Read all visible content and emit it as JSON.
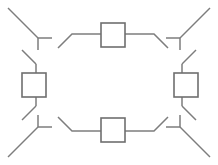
{
  "canvas": {
    "width": 218,
    "height": 165,
    "background": "#ffffff",
    "title": "Symmetric rectangular line diagram with four square nodes"
  },
  "style": {
    "line_color": "#7d7d7d",
    "line_width": 1.5,
    "node_stroke_color": "#6f6f6f",
    "node_stroke_width": 1.6,
    "node_fill": "#ffffff"
  },
  "nodes": [
    {
      "id": "node-top",
      "label": "top-square",
      "x": 101,
      "y": 23,
      "width": 24,
      "height": 24
    },
    {
      "id": "node-bottom",
      "label": "bottom-square",
      "x": 101,
      "y": 118,
      "width": 24,
      "height": 24
    },
    {
      "id": "node-left",
      "label": "left-square",
      "x": 22,
      "y": 73,
      "width": 24,
      "height": 24
    },
    {
      "id": "node-right",
      "label": "right-square",
      "x": 174,
      "y": 73,
      "width": 24,
      "height": 24
    }
  ],
  "edges": [
    {
      "id": "edge-top-left-lead",
      "label": "top-left-outward-diagonal",
      "points": "8,8 38,38"
    },
    {
      "id": "edge-top-left-horizontal",
      "label": "top-left-horizontal-stub",
      "points": "38,38 52,38"
    },
    {
      "id": "edge-top-left-tick",
      "label": "top-left-vertical-tick",
      "points": "38,38 38,50"
    },
    {
      "id": "edge-top-left-to-square",
      "label": "top-left-rise-into-top-square",
      "points": "58,48 72,34 101,34"
    },
    {
      "id": "edge-top-right-to-square",
      "label": "top-right-rise-into-top-square",
      "points": "125,34 154,34 168,48"
    },
    {
      "id": "edge-top-right-horizontal",
      "label": "top-right-horizontal-stub",
      "points": "166,38 180,38"
    },
    {
      "id": "edge-top-right-tick",
      "label": "top-right-vertical-tick",
      "points": "180,38 180,50"
    },
    {
      "id": "edge-top-right-lead",
      "label": "top-right-outward-diagonal",
      "points": "180,38 210,8"
    },
    {
      "id": "edge-left-upper-lead",
      "label": "left-upper-outward-diagonal",
      "points": "22,50 36,64"
    },
    {
      "id": "edge-left-upper-vertical",
      "label": "left-upper-vertical-into-square",
      "points": "36,64 36,73"
    },
    {
      "id": "edge-left-lower-vertical",
      "label": "left-lower-vertical-from-square",
      "points": "36,97 36,106"
    },
    {
      "id": "edge-left-lower-lead",
      "label": "left-lower-outward-diagonal",
      "points": "36,106 22,120"
    },
    {
      "id": "edge-right-upper-lead",
      "label": "right-upper-outward-diagonal",
      "points": "196,50 182,64"
    },
    {
      "id": "edge-right-upper-vertical",
      "label": "right-upper-vertical-into-square",
      "points": "182,64 182,73"
    },
    {
      "id": "edge-right-lower-vertical",
      "label": "right-lower-vertical-from-square",
      "points": "182,97 182,106"
    },
    {
      "id": "edge-right-lower-lead",
      "label": "right-lower-outward-diagonal",
      "points": "182,106 196,120"
    },
    {
      "id": "edge-bottom-left-lead",
      "label": "bottom-left-outward-diagonal",
      "points": "8,157 38,127"
    },
    {
      "id": "edge-bottom-left-horizontal",
      "label": "bottom-left-horizontal-stub",
      "points": "38,127 52,127"
    },
    {
      "id": "edge-bottom-left-tick",
      "label": "bottom-left-vertical-tick",
      "points": "38,127 38,115"
    },
    {
      "id": "edge-bottom-left-to-square",
      "label": "bottom-left-drop-into-bottom-square",
      "points": "58,117 72,131 101,131"
    },
    {
      "id": "edge-bottom-right-to-square",
      "label": "bottom-right-drop-into-bottom-square",
      "points": "125,131 154,131 168,117"
    },
    {
      "id": "edge-bottom-right-horizontal",
      "label": "bottom-right-horizontal-stub",
      "points": "166,127 180,127"
    },
    {
      "id": "edge-bottom-right-tick",
      "label": "bottom-right-vertical-tick",
      "points": "180,127 180,115"
    },
    {
      "id": "edge-bottom-right-lead",
      "label": "bottom-right-outward-diagonal",
      "points": "180,127 210,157"
    }
  ]
}
